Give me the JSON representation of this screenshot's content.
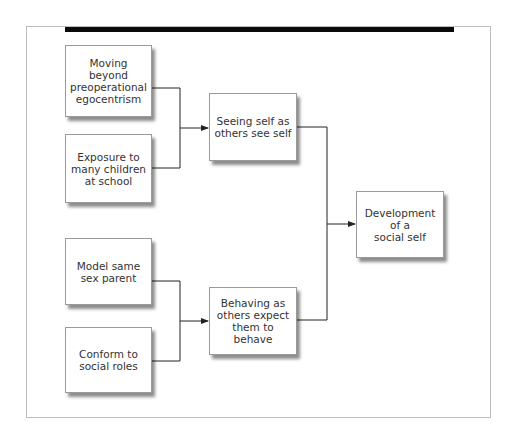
{
  "diagram": {
    "type": "flowchart",
    "nodes": [
      {
        "id": "moving_beyond",
        "label": "Moving beyond\npreoperational\negocentrism"
      },
      {
        "id": "exposure",
        "label": "Exposure to\nmany children\nat school"
      },
      {
        "id": "seeing_self",
        "label": "Seeing self as\nothers see self"
      },
      {
        "id": "development",
        "label": "Development\nof a\nsocial self"
      },
      {
        "id": "model_parent",
        "label": "Model same\nsex parent"
      },
      {
        "id": "conform",
        "label": "Conform to\nsocial roles"
      },
      {
        "id": "behaving",
        "label": "Behaving as\nothers expect\nthem to behave"
      }
    ],
    "edges": [
      {
        "from": "moving_beyond",
        "to": "seeing_self"
      },
      {
        "from": "exposure",
        "to": "seeing_self"
      },
      {
        "from": "model_parent",
        "to": "behaving"
      },
      {
        "from": "conform",
        "to": "behaving"
      },
      {
        "from": "seeing_self",
        "to": "development"
      },
      {
        "from": "behaving",
        "to": "development"
      }
    ],
    "colors": {
      "box_border": "#9a9a9a",
      "line": "#222222",
      "top_bar": "#0a0a0a",
      "frame": "#bdbdbd"
    }
  }
}
